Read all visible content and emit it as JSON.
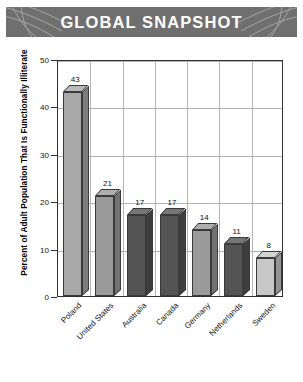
{
  "header": {
    "title": "GLOBAL SNAPSHOT",
    "banner_color": "#6f6f6f",
    "text_color": "#ffffff",
    "ornament_left": "swirl-arcs-left",
    "ornament_right": "swirl-arcs-right"
  },
  "chart_data": {
    "type": "bar",
    "title": "GLOBAL SNAPSHOT",
    "xlabel": "",
    "ylabel": "Percent of Adult Population That Is Functionally Illiterate",
    "categories": [
      "Poland",
      "United States",
      "Australia",
      "Canada",
      "Germany",
      "Netherlands",
      "Sweden"
    ],
    "values": [
      43,
      21,
      17,
      17,
      14,
      11,
      8
    ],
    "data_labels": [
      "43",
      "21",
      "17",
      "17",
      "14",
      "11",
      "8"
    ],
    "bar_colors": [
      "#a8a8a8",
      "#9a9a9a",
      "#545454",
      "#545454",
      "#9a9a9a",
      "#545454",
      "#c8c8c8"
    ],
    "ylim": [
      0,
      50
    ],
    "yticks": [
      0,
      10,
      20,
      30,
      40,
      50
    ],
    "ytick_labels": [
      "0",
      "10",
      "20",
      "30",
      "40",
      "50"
    ],
    "grid": true,
    "grid_color": "#b4b4b4",
    "legend": null,
    "legend_position": "none",
    "three_d": true,
    "axis_color": "#2f2f2f",
    "label_rotation": -45
  }
}
